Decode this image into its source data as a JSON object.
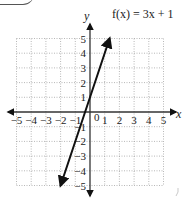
{
  "badge": {
    "label": "SWER"
  },
  "chart_data": {
    "type": "line",
    "title": "f(x) = 3x + 1",
    "xlabel": "x",
    "ylabel": "y",
    "xlim": [
      -5,
      5
    ],
    "ylim": [
      -5,
      5
    ],
    "grid": true,
    "grid_style": "dotted",
    "x_ticks": [
      "-5",
      "-4",
      "-3",
      "-2",
      "-1",
      "0",
      "1",
      "2",
      "3",
      "4",
      "5"
    ],
    "y_ticks": [
      "-5",
      "-4",
      "-3",
      "-2",
      "-1",
      "1",
      "2",
      "3",
      "4",
      "5"
    ],
    "series": [
      {
        "name": "f(x) = 3x + 1",
        "equation": "3x + 1",
        "x": [
          -2,
          -1,
          0,
          1.333
        ],
        "y": [
          -5,
          -2,
          1,
          5
        ],
        "arrows": "both"
      }
    ]
  },
  "labels": {
    "title": "f(x) = 3x + 1",
    "x_axis": "x",
    "y_axis": "y",
    "origin": "0",
    "x_neg": [
      "−5",
      "−4",
      "−3",
      "−2",
      "−1"
    ],
    "x_pos": [
      "1",
      "2",
      "3",
      "4",
      "5"
    ],
    "y_pos": [
      "1",
      "2",
      "3",
      "4",
      "5"
    ],
    "y_neg": [
      "−1",
      "−2",
      "−3",
      "−4",
      "−5"
    ]
  }
}
